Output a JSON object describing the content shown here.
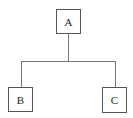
{
  "diagram": {
    "type": "tree",
    "nodes": [
      {
        "id": "A",
        "label": "A",
        "role": "root"
      },
      {
        "id": "B",
        "label": "B",
        "role": "child"
      },
      {
        "id": "C",
        "label": "C",
        "role": "child"
      }
    ],
    "edges": [
      {
        "from": "A",
        "to": "B"
      },
      {
        "from": "A",
        "to": "C"
      }
    ],
    "colors": {
      "border": "#555555",
      "connector": "#777777",
      "background": "#ffffff",
      "text": "#222222"
    }
  }
}
